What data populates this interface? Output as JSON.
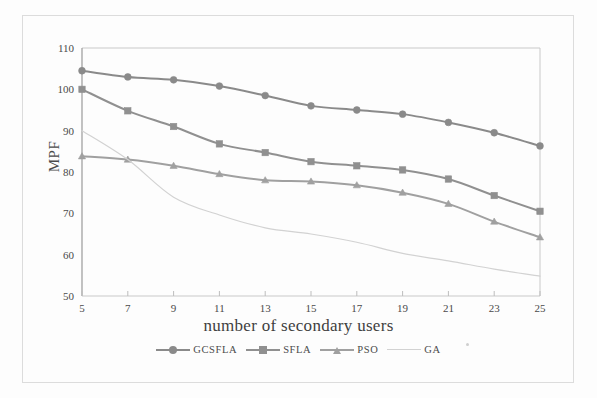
{
  "figure": {
    "title": "",
    "y_axis_label": "MPF",
    "x_axis_label": "number of secondary users"
  },
  "legend": {
    "position": "below-axis",
    "entries": [
      {
        "label": "GCSFLA",
        "color": "#8a8a8a",
        "marker": "circle"
      },
      {
        "label": "SFLA",
        "color": "#909090",
        "marker": "square"
      },
      {
        "label": "PSO",
        "color": "#a0a0a0",
        "marker": "triangle"
      },
      {
        "label": "GA",
        "color": "#d2d2d2",
        "marker": "none"
      }
    ]
  },
  "axes": {
    "x_ticks": [
      "5",
      "7",
      "9",
      "11",
      "13",
      "15",
      "17",
      "19",
      "21",
      "23",
      "25"
    ],
    "y_ticks": [
      "50",
      "60",
      "70",
      "80",
      "90",
      "100",
      "110"
    ],
    "xlim": [
      5,
      25
    ],
    "ylim": [
      50,
      110
    ]
  },
  "chart_data": {
    "type": "line",
    "title": "",
    "xlabel": "number of secondary users",
    "ylabel": "MPF",
    "x": [
      5,
      7,
      9,
      11,
      13,
      15,
      17,
      19,
      21,
      23,
      25
    ],
    "xlim": [
      5,
      25
    ],
    "ylim": [
      50,
      110
    ],
    "xticks": [
      5,
      7,
      9,
      11,
      13,
      15,
      17,
      19,
      21,
      23,
      25
    ],
    "yticks": [
      50,
      60,
      70,
      80,
      90,
      100,
      110
    ],
    "grid": false,
    "legend_position": "below-axis",
    "series": [
      {
        "name": "GCSFLA",
        "color": "#8a8a8a",
        "marker": "circle",
        "values": [
          104.5,
          103.0,
          102.3,
          100.8,
          98.5,
          96.0,
          95.0,
          94.0,
          92.0,
          89.5,
          86.3
        ]
      },
      {
        "name": "SFLA",
        "color": "#909090",
        "marker": "square",
        "values": [
          100.0,
          94.8,
          91.0,
          86.8,
          84.7,
          82.5,
          81.5,
          80.5,
          78.3,
          74.3,
          70.5
        ]
      },
      {
        "name": "PSO",
        "color": "#a0a0a0",
        "marker": "triangle",
        "values": [
          83.8,
          83.0,
          81.5,
          79.5,
          78.0,
          77.7,
          76.8,
          75.0,
          72.3,
          68.0,
          64.2
        ]
      },
      {
        "name": "GA",
        "color": "#d2d2d2",
        "marker": "none",
        "values": [
          90.0,
          83.0,
          73.9,
          69.6,
          66.5,
          65.0,
          63.0,
          60.3,
          58.5,
          56.5,
          54.8
        ]
      }
    ]
  }
}
